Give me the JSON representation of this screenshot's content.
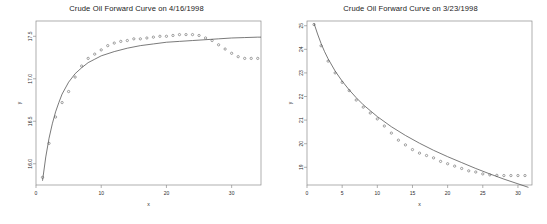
{
  "figure": {
    "background_color": "#ffffff",
    "point_color": "#5a5a5a",
    "curve_color": "#4d4d4d",
    "axis_color": "#8c8c8c"
  },
  "panels": [
    {
      "id": "left",
      "title": "Crude Oil Forward Curve on 4/16/1998"
    },
    {
      "id": "right",
      "title": "Crude Oil Forward Curve on 3/23/1998"
    }
  ],
  "chart_data": [
    {
      "type": "scatter",
      "title": "Crude Oil Forward Curve on 4/16/1998",
      "xlabel": "x",
      "ylabel": "y",
      "xlim": [
        0,
        34.5
      ],
      "ylim": [
        15.75,
        17.68
      ],
      "xticks": [
        0,
        10,
        20,
        30
      ],
      "yticks": [
        16.0,
        16.5,
        17.0,
        17.5
      ],
      "xticklabels": [
        "0",
        "10",
        "20",
        "30"
      ],
      "yticklabels": [
        "16.0",
        "16.5",
        "17.0",
        "17.5"
      ],
      "grid": false,
      "legend": null,
      "series": [
        {
          "name": "observed forward prices",
          "marker": "open-circle",
          "x": [
            1,
            2,
            3,
            4,
            5,
            6,
            7,
            8,
            9,
            10,
            11,
            12,
            13,
            14,
            15,
            16,
            17,
            18,
            19,
            20,
            21,
            22,
            23,
            24,
            25,
            26,
            27,
            28,
            29,
            30,
            31,
            32,
            33,
            34
          ],
          "y": [
            15.84,
            16.24,
            16.55,
            16.72,
            16.85,
            17.02,
            17.15,
            17.24,
            17.29,
            17.34,
            17.39,
            17.42,
            17.44,
            17.45,
            17.47,
            17.47,
            17.48,
            17.49,
            17.5,
            17.5,
            17.51,
            17.52,
            17.52,
            17.52,
            17.51,
            17.48,
            17.45,
            17.4,
            17.35,
            17.3,
            17.26,
            17.24,
            17.24,
            17.24
          ]
        },
        {
          "name": "fitted curve",
          "type": "line",
          "x": [
            1,
            1.5,
            2,
            2.5,
            3,
            3.5,
            4,
            5,
            6,
            7,
            8,
            9,
            10,
            12,
            14,
            16,
            18,
            20,
            22,
            24,
            26,
            28,
            30,
            32,
            34,
            34.5
          ],
          "y": [
            15.8,
            16.08,
            16.3,
            16.47,
            16.61,
            16.72,
            16.82,
            16.96,
            17.06,
            17.13,
            17.19,
            17.23,
            17.27,
            17.32,
            17.36,
            17.39,
            17.41,
            17.43,
            17.44,
            17.45,
            17.46,
            17.47,
            17.48,
            17.485,
            17.49,
            17.49
          ]
        }
      ]
    },
    {
      "type": "scatter",
      "title": "Crude Oil Forward Curve on 3/23/1998",
      "xlabel": "x",
      "ylabel": "y",
      "xlim": [
        0,
        32
      ],
      "ylim": [
        18.25,
        25.2
      ],
      "xticks": [
        0,
        5,
        10,
        15,
        20,
        25,
        30
      ],
      "yticks": [
        19,
        20,
        21,
        22,
        23,
        24,
        25
      ],
      "xticklabels": [
        "0",
        "5",
        "10",
        "15",
        "20",
        "25",
        "30"
      ],
      "yticklabels": [
        "19",
        "20",
        "21",
        "22",
        "23",
        "24",
        "25"
      ],
      "grid": false,
      "legend": null,
      "series": [
        {
          "name": "observed forward prices",
          "marker": "open-circle",
          "x": [
            1,
            2,
            3,
            4,
            5,
            6,
            7,
            8,
            9,
            10,
            11,
            12,
            13,
            14,
            15,
            16,
            17,
            18,
            19,
            20,
            21,
            22,
            23,
            24,
            25,
            26,
            27,
            28,
            29,
            30,
            31
          ],
          "y": [
            25.05,
            24.15,
            23.5,
            23.0,
            22.6,
            22.25,
            21.85,
            21.55,
            21.3,
            21.05,
            20.75,
            20.45,
            20.15,
            19.95,
            19.75,
            19.6,
            19.5,
            19.4,
            19.25,
            19.15,
            19.05,
            18.95,
            18.85,
            18.8,
            18.72,
            18.68,
            18.66,
            18.65,
            18.65,
            18.65,
            18.65
          ]
        },
        {
          "name": "fitted curve",
          "type": "line",
          "x": [
            1,
            1.5,
            2,
            2.5,
            3,
            4,
            5,
            6,
            7,
            8,
            9,
            10,
            12,
            14,
            16,
            18,
            20,
            22,
            24,
            26,
            28,
            30,
            31.5
          ],
          "y": [
            25.1,
            24.65,
            24.25,
            23.9,
            23.6,
            23.08,
            22.65,
            22.28,
            21.95,
            21.65,
            21.4,
            21.15,
            20.72,
            20.35,
            20.02,
            19.72,
            19.45,
            19.2,
            18.95,
            18.72,
            18.5,
            18.3,
            18.15
          ]
        }
      ]
    }
  ]
}
